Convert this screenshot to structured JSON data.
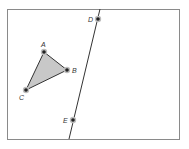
{
  "canvas": {
    "width": 189,
    "height": 149,
    "background": "#ffffff"
  },
  "frame": {
    "x": 7,
    "y": 9,
    "width": 172,
    "height": 130,
    "stroke": "#8a8a8a"
  },
  "triangle": {
    "fill": "#c8c8c8",
    "stroke": "#333333",
    "vertices": [
      {
        "name": "A",
        "x": 44,
        "y": 52,
        "label": "A",
        "label_x": 41,
        "label_y": 47
      },
      {
        "name": "B",
        "x": 67,
        "y": 70,
        "label": "B",
        "label_x": 72,
        "label_y": 73
      },
      {
        "name": "C",
        "x": 26,
        "y": 90,
        "label": "C",
        "label_x": 19,
        "label_y": 100
      }
    ]
  },
  "line": {
    "stroke": "#333333",
    "x1": 100,
    "y1": 9,
    "x2": 69,
    "y2": 139,
    "points": [
      {
        "name": "D",
        "x": 98,
        "y": 19,
        "label": "D",
        "label_x": 88,
        "label_y": 22
      },
      {
        "name": "E",
        "x": 73,
        "y": 120,
        "label": "E",
        "label_x": 63,
        "label_y": 123
      }
    ]
  },
  "point_style": {
    "fill": "#222222",
    "halo": "#bdbdbd",
    "radius": 1.8,
    "halo_radius": 3.2
  }
}
